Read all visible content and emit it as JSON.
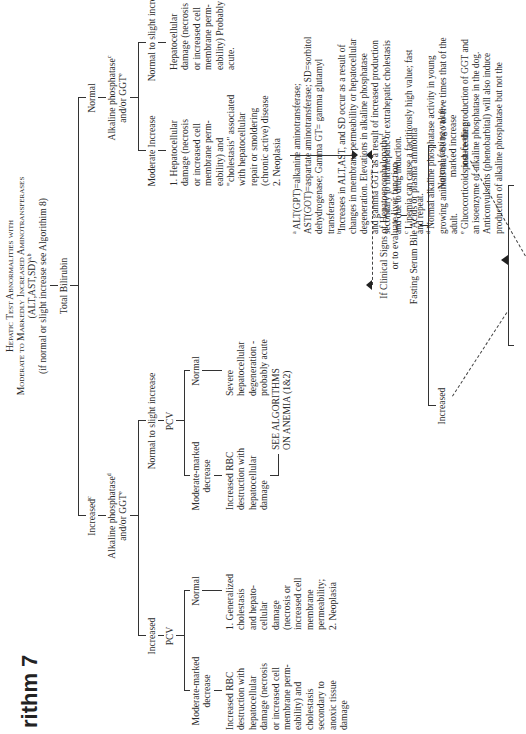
{
  "page": {
    "orientation": "rotated-90-ccw",
    "algorithm_label": "rithm 7",
    "title": {
      "line1": "Hepatic Test Abnormalities with",
      "line2": "Moderate to Markedly Increased Aminotransferases",
      "line3": "(ALT,AST,SD)",
      "line3_sup": "a,b",
      "line4": "(if normal or slight increase see Algorithim 8)"
    },
    "tree": {
      "root": "Total Bilirubin",
      "left": {
        "label": "Increased",
        "label_sup": "c",
        "test": "Alkaline phosphatase",
        "test_sup": "d",
        "test_line2": "and/or GGT",
        "test_line2_sup": "e",
        "increased": {
          "label": "Increased",
          "pcv": "PCV",
          "mm_decrease": "Moderate-marked\ndecrease",
          "mm_result": "Increased RBC\ndestruction with\nhepatocellular\ndamage (necrosis\nor increased cell\nmembrane perm-\neability) and\ncholestasis\nsecondary to\nanoxic tissue\ndamage",
          "normal": "Normal",
          "normal_result": "1. Generalized\ncholestasis\nand hepato-\ncellular\ndamage\n(necrosis or\nincreased cell\nmembrane\npermeability;\n2. Neoplasia"
        },
        "normal_slight": {
          "label": "Normal to slight increase",
          "pcv": "PCV",
          "mm_decrease": "Moderate-marked\ndecrease",
          "mm_result": "Increased RBC\ndestruction with\nhepatocellular\ndamage",
          "see_anemia": "SEE ALGORITHMS\nON ANEMIA (1&2)",
          "normal": "Normal",
          "normal_result": "Severe\nhepatocellular\ndegeneration -\nprobably acute"
        }
      },
      "right": {
        "label": "Normal",
        "test": "Alkaline phosphatase",
        "test_sup": "c",
        "test_line2": "and/or GGT",
        "test_line2_sup": "e",
        "moderate": {
          "label": "Moderate Increase",
          "result": "1. Hepatocellular\ndamage (necrosis\nor increased cell\nmembrane perm-\neability) and\n\"cholestasis\" associated\nwith hepatocellular\nrepair or smoldering\n(chronic active) disease\n2. Neoplasia"
        },
        "normal_slight": {
          "label": "Normal to slight increase",
          "result": "Hepatocellular\ndamage (necrosis\nor increased cell\nmembrane perm-\neability) Probably\nacute."
        }
      },
      "clinical": {
        "line1": "If Clinical Signs of Hepatoencephalopathy",
        "line1_sup": "f",
        "line2": "or to evaluate liver function",
        "test": "Fasting Serum Bile Acids or plasma ammonia",
        "increased": "Increased",
        "normal_fasting": "Normal fasting value -\nmarked increase\npost-feeding"
      }
    },
    "footnotes": [
      {
        "mark": "a",
        "text": "ALT(GPT)=alkanine aminotransferase;\nAST(GOT)=aspartate aminotransferase; SD=sorbitol\ndehydrogenase; Gamma GT= gamma glutamyl\ntransferase"
      },
      {
        "mark": "b",
        "text": "Increases in ALT,AST, and SD occur as a result of\nchanges in membrane permeability or hepatocellular\ndegeneration. Elevations in alkaline phosphatase\nand gamma GGT as a result of increased production\nsecondary to intrahepatic or extrahepatic cholestasis\nand due to drug induction."
      },
      {
        "mark": "c",
        "text": "Lipemia can cause a factitiously high value; fast\nand repeat."
      },
      {
        "mark": "d",
        "text": "Normal alkaline phosphatase activity in young\ngrowing animals may be two to five times that of the\nadult."
      },
      {
        "mark": "e",
        "text": "Glucocorticoids induce the production of GGT and\nan isoenzyme of alkaline phosphatase in the dog.\nAnticonvulsants (phenobarbital) will also induce\nproduction of alkaline phosphatase but not the"
      }
    ]
  }
}
